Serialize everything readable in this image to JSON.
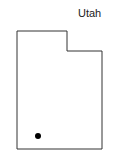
{
  "map": {
    "title": "Utah",
    "marker": {
      "type": "dot",
      "color": "#000000"
    },
    "outline_color": "#333333"
  }
}
